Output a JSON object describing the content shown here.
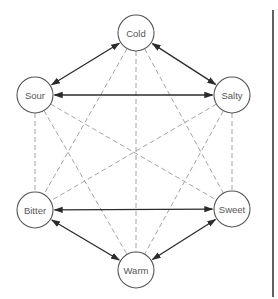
{
  "diagram": {
    "title": "",
    "nodes": [
      {
        "id": "cold",
        "label": "Cold"
      },
      {
        "id": "sour",
        "label": "Sour"
      },
      {
        "id": "salty",
        "label": "Salty"
      },
      {
        "id": "bitter",
        "label": "Bitter"
      },
      {
        "id": "sweet",
        "label": "Sweet"
      },
      {
        "id": "warm",
        "label": "Warm"
      }
    ],
    "solid_bidirectional_edges": [
      [
        "cold",
        "sour"
      ],
      [
        "cold",
        "salty"
      ],
      [
        "sour",
        "salty"
      ],
      [
        "bitter",
        "sweet"
      ],
      [
        "bitter",
        "warm"
      ],
      [
        "sweet",
        "warm"
      ]
    ],
    "dashed_edges": [
      [
        "cold",
        "warm"
      ],
      [
        "cold",
        "bitter"
      ],
      [
        "cold",
        "sweet"
      ],
      [
        "sour",
        "bitter"
      ],
      [
        "sour",
        "sweet"
      ],
      [
        "sour",
        "warm"
      ],
      [
        "salty",
        "sweet"
      ],
      [
        "salty",
        "bitter"
      ],
      [
        "salty",
        "warm"
      ]
    ],
    "colors": {
      "solid": "#2b2b2b",
      "dashed": "#9a9a9a",
      "node_stroke": "#555555",
      "label": "#555555"
    }
  }
}
